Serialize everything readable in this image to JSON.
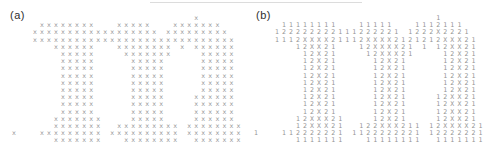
{
  "figure": {
    "background": "#ffffff",
    "char_color": "#949494",
    "label_color": "#2e2e2e",
    "artifact_line_color": "#dcdcdc",
    "panels": [
      {
        "label": "(a)",
        "rows": [
          "                          x",
          "    xxxxxxxx   xxxxx   xxxxxxx",
          "   xxxxxxxxxxxxxxxxxx xxxxxxxxx",
          "   xxxxxxxxxxxxxxxxxxxxxxxxxxxxx",
          "      xxxxxx   xxxxxxxx x xxxxxx",
          "       xxxxx    xxxxxxx    xxxxx",
          "       xxxxx     xxxxx     xxxxx",
          "       xxxxx     xxxxx     xxxxx",
          "       xxxxx     xxxxx     xxxxx",
          "       xxxxx     xxxxx     xxxxx",
          "       xxxxx     xxxxx     xxxxx",
          "       xxxxx     xxxxx    xxxxxx",
          "       xxxxx     xxxxx    xxxxxx",
          "       xxxxx     xxxxx    xxxxxx",
          "      xxxxxxx    xxxxx    xxxxxx",
          "      xxxxxxx  xxxxxxxxx xxxxxxxx",
          "x   xxxxxxxxx xxxxxxxxxx xxxxxxxx",
          "      xxxxxxx   xxxxxxxx  xxxxxxx"
        ]
      },
      {
        "label": "(b)",
        "rows": [
          "                          1",
          "    11111111   11111   1112111",
          "   122222222111222221 1222X2221",
          "   1112XXXX21112XXXX2121212XXX21",
          "      12XX21   12XXXX21 1 12XX21",
          "       12X21    12XXX21    12X21",
          "       12X21     12X21     12X21",
          "       12X21     12X21     12X21",
          "       12X21     12X21     12X21",
          "       12X21     12X21     12X21",
          "       12X21     12X21     12X21",
          "       12X21     12X21    12XX21",
          "       12X21     12X21    12XX21",
          "       12X21     12X21    12XX21",
          "      12XXX21    12X21    12XX21",
          "      12XXX21  122XXX211 12XXXX21",
          "1   112222221 1122222221 12222221",
          "      1111111   11111111  1111111"
        ]
      }
    ]
  }
}
